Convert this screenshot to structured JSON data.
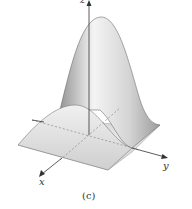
{
  "figure": {
    "caption": "(c)",
    "axes": {
      "x_label": "x",
      "y_label": "y",
      "z_label": "z"
    },
    "surface": "bell-shaped surface with tall peak and smaller ridge over square base",
    "colors": {
      "surface_light": "#f2f2f2",
      "surface_dark": "#9a9a9a",
      "axis": "#333333",
      "outline": "#555555"
    }
  }
}
